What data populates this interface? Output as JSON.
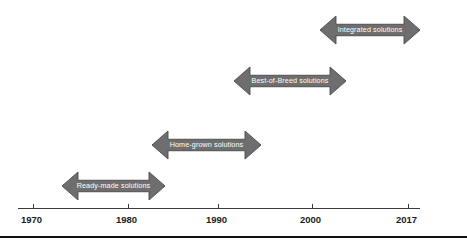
{
  "diagram": {
    "accent_color": "#6e6e6e",
    "arrow_outline_color": "#4a4a4a",
    "arrow_label_color": "#ffffff",
    "axis_color": "#3a3a3a",
    "axis_label_color": "#1c1c1c",
    "bottom_rule_color": "#111111"
  },
  "axis": {
    "name": "timeline-axis",
    "line": {
      "x": 18,
      "y": 208,
      "width": 402
    },
    "ticks": [
      {
        "label": "1970",
        "x": 33,
        "label_x": 21,
        "label_y": 215
      },
      {
        "label": "1980",
        "x": 128,
        "label_x": 116,
        "label_y": 215
      },
      {
        "label": "1990",
        "x": 218,
        "label_x": 206,
        "label_y": 215
      },
      {
        "label": "2000",
        "x": 312,
        "label_x": 300,
        "label_y": 215
      },
      {
        "label": "2017",
        "x": 408,
        "label_x": 396,
        "label_y": 215
      }
    ]
  },
  "arrows": [
    {
      "name": "arrow-ready-made-solutions",
      "label": "Ready-made solutions",
      "x": 62,
      "y": 172,
      "width": 103,
      "height": 28,
      "start_year": 1970,
      "end_year": 1980
    },
    {
      "name": "arrow-home-grown-solutions",
      "label": "Home-grown solutions",
      "x": 152,
      "y": 131,
      "width": 109,
      "height": 28,
      "start_year": 1980,
      "end_year": 1991
    },
    {
      "name": "arrow-best-of-breed-solutions",
      "label": "Best-of-Breed solutions",
      "x": 234,
      "y": 67,
      "width": 112,
      "height": 28,
      "start_year": 1990,
      "end_year": 2002
    },
    {
      "name": "arrow-integrated-solutions",
      "label": "Integrated solutions",
      "x": 320,
      "y": 16,
      "width": 100,
      "height": 28,
      "start_year": 2001,
      "end_year": 2012
    }
  ],
  "bottom_rule": {
    "x": 0,
    "y": 236,
    "width": 467,
    "height": 2
  }
}
